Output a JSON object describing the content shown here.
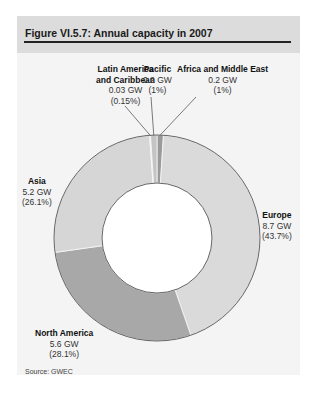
{
  "header": {
    "title": "Figure VI.5.7: Annual capacity in 2007"
  },
  "source": "Source: GWEC",
  "labels": {
    "latin_america": {
      "name_line1": "Latin America",
      "name_line2": "and Caribbean",
      "value": "0.03 GW",
      "pct": "(0.15%)"
    },
    "pacific": {
      "name": "Pacific",
      "value": "0.2 GW",
      "pct": "(1%)"
    },
    "africa_me": {
      "name": "Africa and Middle East",
      "value": "0.2 GW",
      "pct": "(1%)"
    },
    "asia": {
      "name": "Asia",
      "value": "5.2 GW",
      "pct": "(26.1%)"
    },
    "europe": {
      "name": "Europe",
      "value": "8.7 GW",
      "pct": "(43.7%)"
    },
    "north_america": {
      "name": "North America",
      "value": "5.6 GW",
      "pct": "(28.1%)"
    }
  },
  "colors": {
    "europe": "#dadada",
    "north_america": "#a8a8a8",
    "asia": "#d6d6d6",
    "latin_america": "#e6e6e6",
    "pacific": "#c4c4c4",
    "africa_me": "#9a9a9a",
    "outline": "#555555"
  },
  "chart_data": {
    "type": "pie",
    "variant": "donut",
    "title": "Figure VI.5.7: Annual capacity in 2007",
    "unit": "GW",
    "categories": [
      "Africa and Middle East",
      "Europe",
      "North America",
      "Asia",
      "Latin America and Caribbean",
      "Pacific"
    ],
    "values": [
      0.2,
      8.7,
      5.6,
      5.2,
      0.03,
      0.2
    ],
    "percentages": [
      1,
      43.7,
      28.1,
      26.1,
      0.15,
      1
    ],
    "legend": "none (direct labels)",
    "source": "GWEC"
  }
}
